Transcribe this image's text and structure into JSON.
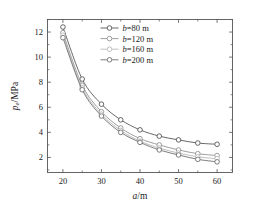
{
  "chart_data": {
    "type": "line",
    "title": "",
    "subtitle": "",
    "xlabel": "a/m",
    "ylabel": "p_e/MPa",
    "xlabel_parts": {
      "var": "a",
      "unit": "/m"
    },
    "ylabel_parts": {
      "var": "p",
      "sub": "e",
      "unit": "/MPa"
    },
    "x": [
      20,
      25,
      30,
      35,
      40,
      45,
      50,
      55,
      60
    ],
    "xlim": [
      16,
      64
    ],
    "ylim": [
      0.8,
      13.0
    ],
    "xticks": [
      20,
      30,
      40,
      50,
      60
    ],
    "xticklabels": [
      "20",
      "30",
      "40",
      "50",
      "60"
    ],
    "yticks": [
      2,
      4,
      6,
      8,
      10,
      12
    ],
    "yticklabels": [
      "2",
      "4",
      "6",
      "8",
      "10",
      "12"
    ],
    "xminorticks": [
      25,
      35,
      45,
      55
    ],
    "yminorticks": [
      1,
      3,
      5,
      7,
      9,
      11,
      13
    ],
    "grid": false,
    "legend_position": "upper-right-inside",
    "marker": "circle-open",
    "series": [
      {
        "name": "b=80 m",
        "label_var": "b",
        "label_value": "=80 m",
        "color": "#4d4d4d",
        "values": [
          12.4,
          8.25,
          6.25,
          5.0,
          4.2,
          3.7,
          3.4,
          3.15,
          3.05
        ]
      },
      {
        "name": "b=120 m",
        "label_var": "b",
        "label_value": "=120 m",
        "color": "#8c8c8c",
        "values": [
          11.95,
          7.75,
          5.65,
          4.35,
          3.5,
          3.0,
          2.6,
          2.3,
          2.15
        ]
      },
      {
        "name": "b=160 m",
        "label_var": "b",
        "label_value": "=160 m",
        "color": "#b3b3b3",
        "values": [
          11.75,
          7.55,
          5.45,
          4.15,
          3.3,
          2.75,
          2.35,
          2.05,
          1.9
        ]
      },
      {
        "name": "b=200 m",
        "label_var": "b",
        "label_value": "=200 m",
        "color": "#666666",
        "values": [
          11.55,
          7.4,
          5.3,
          4.0,
          3.2,
          2.6,
          2.2,
          1.85,
          1.65
        ]
      }
    ]
  }
}
